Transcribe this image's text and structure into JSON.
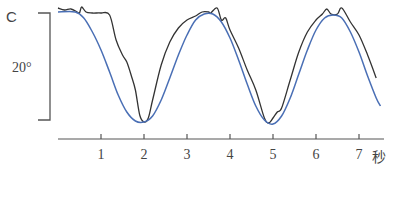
{
  "chart_data": {
    "type": "line",
    "title": "",
    "xlabel": "秒",
    "ylabel": "C",
    "scale_bar_label": "20°",
    "x_ticks": [
      "1",
      "2",
      "3",
      "4",
      "5",
      "6",
      "7"
    ],
    "xlim": [
      0,
      7.6
    ],
    "grid": false,
    "legend": "none",
    "series": [
      {
        "name": "measured (black, jagged)",
        "color": "#333333",
        "points": [
          [
            0.0,
            8
          ],
          [
            0.15,
            10
          ],
          [
            0.3,
            9
          ],
          [
            0.45,
            12
          ],
          [
            0.5,
            13
          ],
          [
            0.55,
            7
          ],
          [
            0.65,
            12
          ],
          [
            0.8,
            13
          ],
          [
            1.0,
            13
          ],
          [
            1.2,
            15
          ],
          [
            1.35,
            40
          ],
          [
            1.5,
            55
          ],
          [
            1.6,
            62
          ],
          [
            1.7,
            75
          ],
          [
            1.8,
            90
          ],
          [
            1.9,
            115
          ],
          [
            2.0,
            122
          ],
          [
            2.1,
            118
          ],
          [
            2.2,
            100
          ],
          [
            2.4,
            65
          ],
          [
            2.6,
            42
          ],
          [
            2.8,
            28
          ],
          [
            3.0,
            20
          ],
          [
            3.2,
            16
          ],
          [
            3.35,
            12
          ],
          [
            3.5,
            12
          ],
          [
            3.55,
            13
          ],
          [
            3.7,
            8
          ],
          [
            3.8,
            20
          ],
          [
            3.9,
            18
          ],
          [
            4.0,
            30
          ],
          [
            4.2,
            48
          ],
          [
            4.4,
            70
          ],
          [
            4.6,
            90
          ],
          [
            4.8,
            118
          ],
          [
            4.9,
            123
          ],
          [
            5.0,
            118
          ],
          [
            5.1,
            112
          ],
          [
            5.2,
            108
          ],
          [
            5.4,
            80
          ],
          [
            5.6,
            52
          ],
          [
            5.8,
            32
          ],
          [
            6.0,
            20
          ],
          [
            6.15,
            14
          ],
          [
            6.25,
            9
          ],
          [
            6.35,
            14
          ],
          [
            6.5,
            14
          ],
          [
            6.6,
            8
          ],
          [
            6.8,
            22
          ],
          [
            7.0,
            35
          ],
          [
            7.2,
            55
          ],
          [
            7.4,
            78
          ]
        ]
      },
      {
        "name": "model (blue, smooth)",
        "color": "#4a6fb5",
        "points": [
          [
            0.0,
            12
          ],
          [
            0.4,
            12
          ],
          [
            0.6,
            18
          ],
          [
            0.8,
            32
          ],
          [
            1.0,
            50
          ],
          [
            1.2,
            72
          ],
          [
            1.4,
            95
          ],
          [
            1.6,
            112
          ],
          [
            1.8,
            121
          ],
          [
            2.0,
            122
          ],
          [
            2.2,
            116
          ],
          [
            2.4,
            100
          ],
          [
            2.6,
            78
          ],
          [
            2.8,
            55
          ],
          [
            3.0,
            35
          ],
          [
            3.2,
            20
          ],
          [
            3.4,
            14
          ],
          [
            3.6,
            14
          ],
          [
            3.8,
            22
          ],
          [
            4.0,
            38
          ],
          [
            4.2,
            60
          ],
          [
            4.4,
            84
          ],
          [
            4.6,
            106
          ],
          [
            4.8,
            120
          ],
          [
            5.0,
            124
          ],
          [
            5.2,
            116
          ],
          [
            5.4,
            98
          ],
          [
            5.6,
            74
          ],
          [
            5.8,
            50
          ],
          [
            6.0,
            30
          ],
          [
            6.2,
            18
          ],
          [
            6.4,
            15
          ],
          [
            6.6,
            18
          ],
          [
            6.8,
            32
          ],
          [
            7.0,
            52
          ],
          [
            7.2,
            76
          ],
          [
            7.4,
            98
          ],
          [
            7.5,
            106
          ]
        ]
      }
    ]
  },
  "labels": {
    "y_unit": "C",
    "scale": "20°",
    "x_unit": "秒"
  }
}
